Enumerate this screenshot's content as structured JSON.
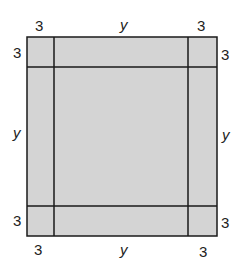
{
  "diagram": {
    "type": "square with corner cutouts",
    "fill_color": "#d4d4d4",
    "line_color": "#1a1a1a",
    "labels": {
      "top_left_corner_width": "3",
      "top_middle": "y",
      "top_right_corner_width": "3",
      "left_top_corner_height": "3",
      "left_middle": "y",
      "left_bottom_corner_height": "3",
      "right_top_corner_height": "3",
      "right_middle": "y",
      "right_bottom_corner_height": "3",
      "bottom_left_corner_width": "3",
      "bottom_middle": "y",
      "bottom_right_corner_width": "3"
    }
  }
}
